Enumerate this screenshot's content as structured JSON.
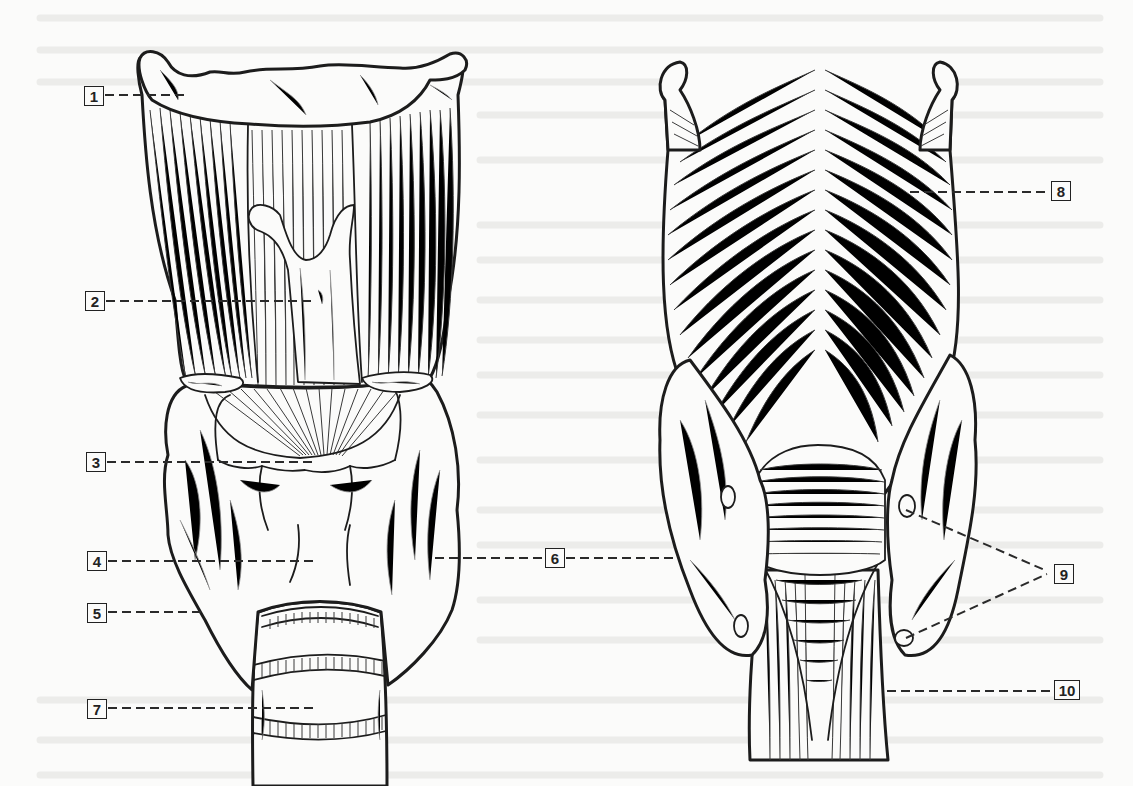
{
  "diagram": {
    "views": [
      {
        "id": "anterior",
        "position": "left"
      },
      {
        "id": "posterior",
        "position": "right"
      }
    ],
    "style": {
      "line_color": "#1c1c1c",
      "background": "#fbfbfa",
      "label_box_border": "#222222"
    },
    "labels": [
      {
        "number": "1",
        "view": "anterior",
        "box": [
          84,
          86
        ],
        "pointer": [
          [
            105,
            95
          ],
          [
            185,
            95
          ]
        ]
      },
      {
        "number": "2",
        "view": "anterior",
        "box": [
          85,
          291
        ],
        "pointer": [
          [
            106,
            301
          ],
          [
            315,
            301
          ]
        ]
      },
      {
        "number": "3",
        "view": "anterior",
        "box": [
          86,
          452
        ],
        "pointer": [
          [
            107,
            462
          ],
          [
            316,
            462
          ]
        ]
      },
      {
        "number": "4",
        "view": "anterior",
        "box": [
          87,
          551
        ],
        "pointer": [
          [
            108,
            561
          ],
          [
            316,
            561
          ]
        ]
      },
      {
        "number": "5",
        "view": "anterior",
        "box": [
          87,
          603
        ],
        "pointer": [
          [
            108,
            612
          ],
          [
            203,
            612
          ]
        ]
      },
      {
        "number": "6",
        "view": "between",
        "box": [
          545,
          548
        ],
        "pointer": [
          [
            435,
            558
          ],
          [
            545,
            558
          ]
        ],
        "pointer2": [
          [
            566,
            558
          ],
          [
            680,
            558
          ]
        ]
      },
      {
        "number": "7",
        "view": "anterior",
        "box": [
          87,
          699
        ],
        "pointer": [
          [
            108,
            708
          ],
          [
            318,
            708
          ]
        ]
      },
      {
        "number": "8",
        "view": "posterior",
        "box": [
          1051,
          181
        ],
        "pointer": [
          [
            910,
            192
          ],
          [
            1050,
            192
          ]
        ]
      },
      {
        "number": "9",
        "view": "posterior",
        "box": [
          1054,
          564
        ],
        "pointer": [
          [
            906,
            510
          ],
          [
            1047,
            571
          ]
        ],
        "pointer2": [
          [
            906,
            638
          ],
          [
            1047,
            574
          ]
        ]
      },
      {
        "number": "10",
        "view": "posterior",
        "box": [
          1054,
          680
        ],
        "pointer": [
          [
            887,
            691
          ],
          [
            1053,
            691
          ]
        ]
      }
    ]
  }
}
